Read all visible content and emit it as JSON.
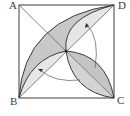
{
  "diagram": {
    "type": "geometry",
    "vertices": {
      "A": "A",
      "B": "B",
      "C": "C",
      "D": "D"
    },
    "labels": [
      {
        "id": "A",
        "text": "A",
        "position": "top-left"
      },
      {
        "id": "D",
        "text": "D",
        "position": "top-right"
      },
      {
        "id": "B",
        "text": "B",
        "position": "bottom-left"
      },
      {
        "id": "C",
        "text": "C",
        "position": "bottom-right"
      }
    ],
    "elements": [
      {
        "kind": "square",
        "vertices": [
          "A",
          "D",
          "C",
          "B"
        ]
      },
      {
        "kind": "segment",
        "from": "A",
        "to": "C",
        "role": "diagonal"
      },
      {
        "kind": "segment",
        "from": "B",
        "to": "D",
        "role": "diagonal"
      },
      {
        "kind": "lens",
        "from": "B",
        "to": "D",
        "shading": "dark/light split along diagonal"
      },
      {
        "kind": "lens",
        "from": "B",
        "to": "O",
        "shading": "light"
      },
      {
        "kind": "lens",
        "from": "O",
        "to": "C",
        "shading": "dark/light split along diagonal"
      },
      {
        "kind": "rotation-arrow",
        "about": "O",
        "direction": "counterclockwise",
        "toward": "D"
      },
      {
        "kind": "rotation-arrow",
        "about": "O",
        "direction": "counterclockwise",
        "toward": "B"
      }
    ],
    "colors": {
      "stroke": "#3c3c3c",
      "dark_fill": "#c8c8c8",
      "light_fill": "#e6e6e6",
      "background": "#ffffff"
    }
  }
}
